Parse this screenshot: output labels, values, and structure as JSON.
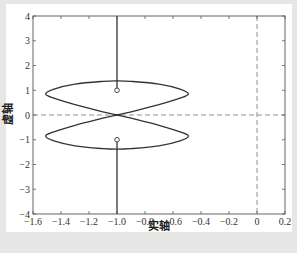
{
  "chart_data": {
    "type": "line",
    "title": "",
    "xlabel": "实轴",
    "ylabel": "虚轴",
    "xlim": [
      -1.6,
      0.2
    ],
    "ylim": [
      -4,
      4
    ],
    "grid": false,
    "xticks": [
      -1.6,
      -1.4,
      -1.2,
      -1.0,
      -0.8,
      -0.6,
      -0.4,
      -0.2,
      0,
      0.2
    ],
    "xtick_labels": [
      "-1.6",
      "-1.4",
      "-1.2",
      "-1.0",
      "-0.8",
      "-0.6",
      "-0.4",
      "-0.2",
      "0",
      "0.2"
    ],
    "yticks": [
      -4,
      -3,
      -2,
      -1,
      0,
      1,
      2,
      3,
      4
    ],
    "ytick_labels": [
      "-4",
      "-3",
      "-2",
      "-1",
      "0",
      "1",
      "2",
      "3",
      "4"
    ],
    "reference_lines": [
      {
        "orientation": "horizontal",
        "value": 0,
        "style": "dashed"
      },
      {
        "orientation": "vertical",
        "value": 0,
        "style": "dashed"
      }
    ],
    "series": [
      {
        "name": "upper-loop",
        "x": [
          -1.0,
          -1.15,
          -1.3,
          -1.45,
          -1.51,
          -1.45,
          -1.3,
          -1.1,
          -1.0,
          -0.9,
          -0.7,
          -0.55,
          -0.49,
          -0.55,
          -0.7,
          -0.85,
          -1.0
        ],
        "y": [
          0,
          0.2,
          0.42,
          0.68,
          0.85,
          1.05,
          1.25,
          1.36,
          1.38,
          1.36,
          1.25,
          1.05,
          0.85,
          0.68,
          0.42,
          0.2,
          0
        ]
      },
      {
        "name": "lower-loop",
        "x": [
          -1.0,
          -1.15,
          -1.3,
          -1.45,
          -1.51,
          -1.45,
          -1.3,
          -1.1,
          -1.0,
          -0.9,
          -0.7,
          -0.55,
          -0.49,
          -0.55,
          -0.7,
          -0.85,
          -1.0
        ],
        "y": [
          0,
          -0.2,
          -0.42,
          -0.68,
          -0.85,
          -1.05,
          -1.25,
          -1.36,
          -1.38,
          -1.36,
          -1.25,
          -1.05,
          -0.85,
          -0.68,
          -0.42,
          -0.2,
          0
        ]
      },
      {
        "name": "upper-branch",
        "x": [
          -1.0,
          -1.0
        ],
        "y": [
          1.0,
          4.0
        ]
      },
      {
        "name": "lower-branch",
        "x": [
          -1.0,
          -1.0
        ],
        "y": [
          -1.0,
          -4.0
        ]
      }
    ],
    "markers": [
      {
        "shape": "circle",
        "x": -1.0,
        "y": 1.0
      },
      {
        "shape": "circle",
        "x": -1.0,
        "y": -1.0
      }
    ]
  }
}
